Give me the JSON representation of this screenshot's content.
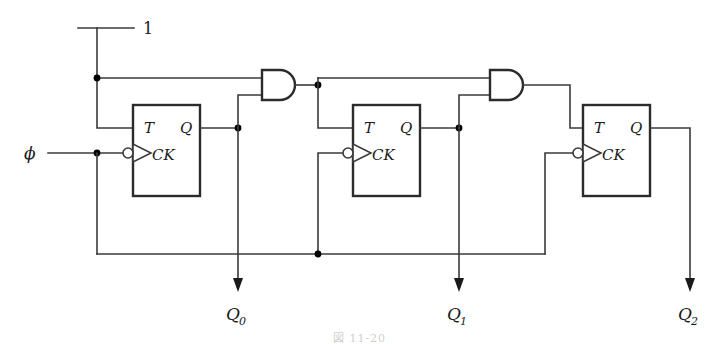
{
  "diagram": {
    "caption": "図 11-20",
    "colors": {
      "wire": "#3a3a3a",
      "outline": "#2b2b2b",
      "text": "#1a1a1a",
      "background": "#ffffff"
    },
    "inputs": {
      "logic_one": {
        "label": "1",
        "name": "logic-one-source"
      },
      "clock": {
        "label": "ϕ",
        "name": "clock-input"
      }
    },
    "flipflops": [
      {
        "id": "ff0",
        "pin_t": "T",
        "pin_q": "Q",
        "pin_ck": "CK",
        "output_label": "Q",
        "output_sub": "0"
      },
      {
        "id": "ff1",
        "pin_t": "T",
        "pin_q": "Q",
        "pin_ck": "CK",
        "output_label": "Q",
        "output_sub": "1"
      },
      {
        "id": "ff2",
        "pin_t": "T",
        "pin_q": "Q",
        "pin_ck": "CK",
        "output_label": "Q",
        "output_sub": "2"
      }
    ],
    "gates": [
      {
        "id": "and0",
        "type": "AND",
        "inputs": 2,
        "name": "and-gate-1"
      },
      {
        "id": "and1",
        "type": "AND",
        "inputs": 2,
        "name": "and-gate-2"
      }
    ],
    "outputs": [
      {
        "label": "Q",
        "sub": "0"
      },
      {
        "label": "Q",
        "sub": "1"
      },
      {
        "label": "Q",
        "sub": "2"
      }
    ]
  }
}
